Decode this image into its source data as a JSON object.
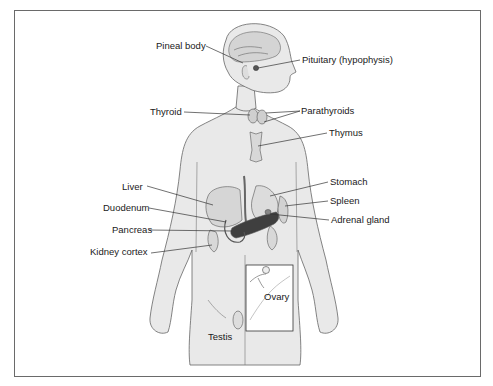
{
  "figure": {
    "title": "",
    "labels": {
      "pineal_body": "Pineal body",
      "pituitary": "Pituitary (hypophysis)",
      "thyroid": "Thyroid",
      "parathyroids": "Parathyroids",
      "thymus": "Thymus",
      "liver": "Liver",
      "stomach": "Stomach",
      "duodenum": "Duodenum",
      "spleen": "Spleen",
      "adrenal_gland": "Adrenal gland",
      "pancreas": "Pancreas",
      "kidney_cortex": "Kidney cortex",
      "ovary": "Ovary",
      "testis": "Testis"
    },
    "colors": {
      "body_fill": "#e9e9e9",
      "outline": "#555555",
      "organ_fill": "#d4d4d4",
      "organ_dark": "#444444",
      "frame": "#6a6a6a",
      "text": "#1a1a1a"
    }
  }
}
